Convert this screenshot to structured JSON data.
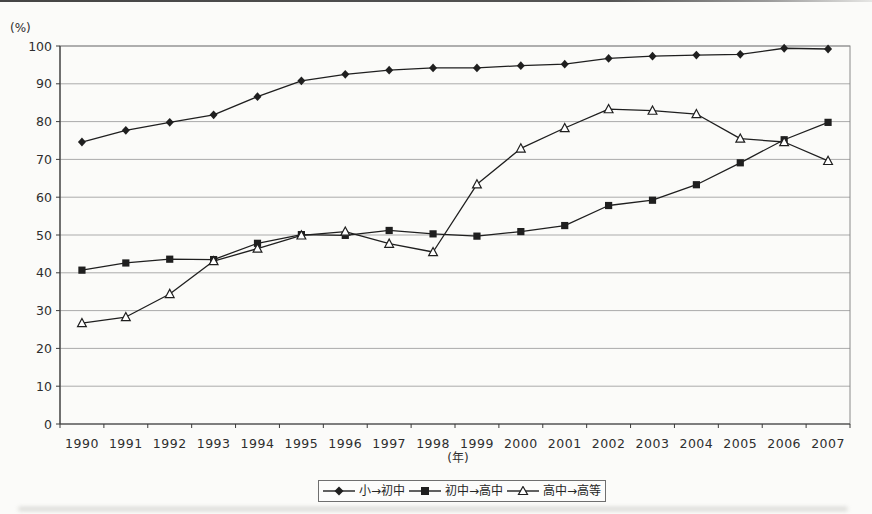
{
  "chart_data": {
    "type": "line",
    "title": "",
    "ylabel": "(%)",
    "xlabel": "(年)",
    "ylim": [
      0,
      100
    ],
    "ytick_step": 10,
    "yticks": [
      0,
      10,
      20,
      30,
      40,
      50,
      60,
      70,
      80,
      90,
      100
    ],
    "grid": "horizontal",
    "legend_position": "bottom",
    "line_color": "#1f1f1f",
    "gridline_color": "#ababab",
    "categories": [
      "1990",
      "1991",
      "1992",
      "1993",
      "1994",
      "1995",
      "1996",
      "1997",
      "1998",
      "1999",
      "2000",
      "2001",
      "2002",
      "2003",
      "2004",
      "2005",
      "2006",
      "2007"
    ],
    "series": [
      {
        "name": "小→初中",
        "marker": "diamond-filled",
        "color": "#1f1f1f",
        "values": [
          74.6,
          77.7,
          79.8,
          81.8,
          86.6,
          90.8,
          92.5,
          93.6,
          94.2,
          94.2,
          94.8,
          95.2,
          96.7,
          97.3,
          97.6,
          97.8,
          99.4,
          99.2
        ]
      },
      {
        "name": "初中→高中",
        "marker": "square-filled",
        "color": "#1f1f1f",
        "values": [
          40.7,
          42.6,
          43.6,
          43.5,
          47.8,
          50.1,
          49.9,
          51.2,
          50.3,
          49.7,
          50.9,
          52.5,
          57.8,
          59.2,
          63.3,
          69.1,
          75.2,
          79.8
        ]
      },
      {
        "name": "高中→高等",
        "marker": "triangle-open",
        "color": "#1f1f1f",
        "values": [
          26.7,
          28.3,
          34.4,
          43.1,
          46.4,
          49.9,
          50.9,
          47.7,
          45.5,
          63.4,
          72.9,
          78.3,
          83.3,
          82.9,
          82.0,
          75.5,
          74.6,
          69.6
        ]
      }
    ]
  }
}
